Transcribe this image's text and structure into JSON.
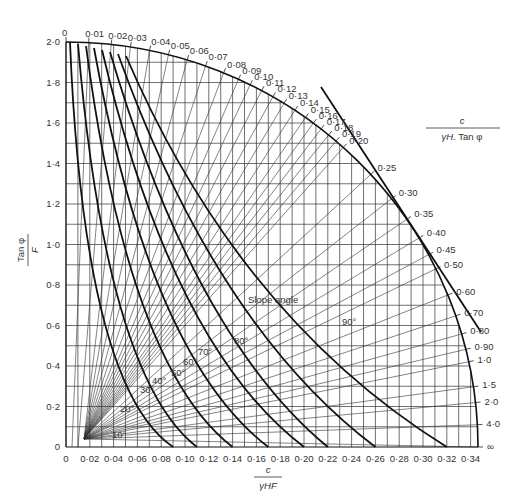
{
  "chart_data": {
    "type": "line",
    "title": "",
    "xlabel": "c / γHF",
    "ylabel": "Tan φ / F",
    "radial_label": "c / γH.Tan φ",
    "slope_angle_label": "Slope angle",
    "xlim": [
      0,
      0.35
    ],
    "ylim": [
      0,
      2.0
    ],
    "grid": true,
    "x_ticks": [
      "0",
      "0·02",
      "0·04",
      "0·06",
      "0·08",
      "0·10",
      "0·12",
      "0·14",
      "0·16",
      "0·18",
      "0·20",
      "0·22",
      "0·24",
      "0·26",
      "0·28",
      "0·30",
      "0·32",
      "0·34"
    ],
    "y_ticks": [
      "0",
      "0·2",
      "0·4",
      "0·6",
      "0·8",
      "1·0",
      "1·2",
      "1·4",
      "1·6",
      "1·8",
      "2·0"
    ],
    "radial_lines": [
      "0",
      "0·01",
      "0·02",
      "0·03",
      "0·04",
      "0·05",
      "0·06",
      "0·07",
      "0·08",
      "0·09",
      "0·10",
      "0·11",
      "0·12",
      "0·13",
      "0·14",
      "0·15",
      "0·16",
      "0·17",
      "0·18",
      "0·19",
      "0·20",
      "0·25",
      "0·30",
      "0·35",
      "0·40",
      "0·45",
      "0·50",
      "0·60",
      "0·70",
      "0·80",
      "0·90",
      "1·0",
      "1·5",
      "2·0",
      "4·0",
      "∞"
    ],
    "slope_angle_curves": [
      {
        "name": "10°",
        "x_intercept": 0.09
      },
      {
        "name": "20°",
        "x_intercept": 0.11
      },
      {
        "name": "30°",
        "x_intercept": 0.14
      },
      {
        "name": "40°",
        "x_intercept": 0.17
      },
      {
        "name": "50°",
        "x_intercept": 0.2
      },
      {
        "name": "60°",
        "x_intercept": 0.22
      },
      {
        "name": "70°",
        "x_intercept": 0.26
      },
      {
        "name": "80°",
        "x_intercept": 0.32
      },
      {
        "name": "90°",
        "from_ratio": "0·08",
        "to_ratio": "0·80"
      }
    ],
    "angle_labels": [
      "10°",
      "20°",
      "30°",
      "40°",
      "50°",
      "60°",
      "70°",
      "80°",
      "90°"
    ]
  }
}
